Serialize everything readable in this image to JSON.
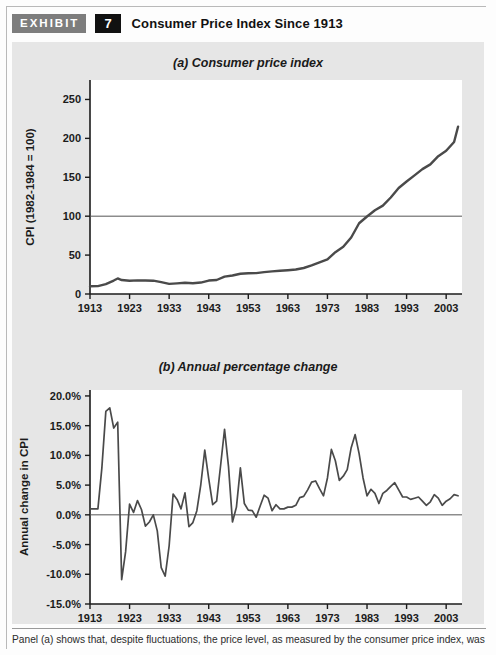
{
  "exhibit": {
    "tag_label": "EXHIBIT",
    "number": "7",
    "title": "Consumer Price Index Since 1913",
    "tag_bg": "#7d7d7d",
    "number_bg": "#111111",
    "panel_bg": "#e6e6e6"
  },
  "caption": {
    "text": "Panel (a) shows that, despite fluctuations, the price level, as measured by the consumer price index, was"
  },
  "chart_data": [
    {
      "id": "a",
      "type": "line",
      "title": "(a) Consumer price index",
      "xlabel": "",
      "ylabel": "CPI (1982-1984 = 100)",
      "ylim": [
        0,
        275
      ],
      "xlim": [
        1913,
        2007
      ],
      "yticks": [
        0,
        50,
        100,
        150,
        200,
        250
      ],
      "ytick_labels": [
        "0",
        "50",
        "100",
        "150",
        "200",
        "250"
      ],
      "xticks": [
        1913,
        1923,
        1933,
        1943,
        1953,
        1963,
        1973,
        1983,
        1993,
        2003
      ],
      "xtick_labels": [
        "1913",
        "1923",
        "1933",
        "1943",
        "1953",
        "1963",
        "1973",
        "1983",
        "1993",
        "2003"
      ],
      "grid": false,
      "reference_line": {
        "value": 100,
        "label": "100"
      },
      "legend": "none",
      "line_color": "#4a4a4a",
      "x": [
        1913,
        1915,
        1917,
        1919,
        1920,
        1921,
        1923,
        1925,
        1927,
        1929,
        1931,
        1933,
        1935,
        1937,
        1939,
        1941,
        1943,
        1945,
        1947,
        1949,
        1951,
        1953,
        1955,
        1957,
        1959,
        1961,
        1963,
        1965,
        1967,
        1969,
        1971,
        1973,
        1975,
        1977,
        1979,
        1981,
        1983,
        1985,
        1987,
        1989,
        1991,
        1993,
        1995,
        1997,
        1999,
        2001,
        2003,
        2005,
        2006
      ],
      "values": [
        9.9,
        10.1,
        12.8,
        17.3,
        20.0,
        17.9,
        17.1,
        17.5,
        17.4,
        17.1,
        15.2,
        13.0,
        13.7,
        14.4,
        13.9,
        14.7,
        17.3,
        18.0,
        22.3,
        23.8,
        26.0,
        26.7,
        26.8,
        28.1,
        29.1,
        29.9,
        30.6,
        31.5,
        33.4,
        36.7,
        40.5,
        44.4,
        53.8,
        60.6,
        72.6,
        90.9,
        99.6,
        107.6,
        113.6,
        124.0,
        136.2,
        144.5,
        152.4,
        160.5,
        166.6,
        177.1,
        184.0,
        195.3,
        215.0
      ]
    },
    {
      "id": "b",
      "type": "line",
      "title": "(b) Annual percentage change",
      "xlabel": "",
      "ylabel": "Annual change in CPI",
      "ylim": [
        -15,
        21
      ],
      "xlim": [
        1913,
        2007
      ],
      "yticks": [
        -15,
        -10,
        -5,
        0,
        5,
        10,
        15,
        20
      ],
      "ytick_labels": [
        "-15.0%",
        "-10.0%",
        "-5.0%",
        "0.0%",
        "5.0%",
        "10.0%",
        "15.0%",
        "20.0%"
      ],
      "xticks": [
        1913,
        1923,
        1933,
        1943,
        1953,
        1963,
        1973,
        1983,
        1993,
        2003
      ],
      "xtick_labels": [
        "1913",
        "1923",
        "1933",
        "1943",
        "1953",
        "1963",
        "1973",
        "1983",
        "1993",
        "2003"
      ],
      "grid": false,
      "reference_line": {
        "value": 0,
        "label": "0.0%"
      },
      "legend": "none",
      "line_color": "#4a4a4a",
      "x": [
        1913,
        1914,
        1915,
        1916,
        1917,
        1918,
        1919,
        1920,
        1921,
        1922,
        1923,
        1924,
        1925,
        1926,
        1927,
        1928,
        1929,
        1930,
        1931,
        1932,
        1933,
        1934,
        1935,
        1936,
        1937,
        1938,
        1939,
        1940,
        1941,
        1942,
        1943,
        1944,
        1945,
        1946,
        1947,
        1948,
        1949,
        1950,
        1951,
        1952,
        1953,
        1954,
        1955,
        1956,
        1957,
        1958,
        1959,
        1960,
        1961,
        1962,
        1963,
        1964,
        1965,
        1966,
        1967,
        1968,
        1969,
        1970,
        1971,
        1972,
        1973,
        1974,
        1975,
        1976,
        1977,
        1978,
        1979,
        1980,
        1981,
        1982,
        1983,
        1984,
        1985,
        1986,
        1987,
        1988,
        1989,
        1990,
        1991,
        1992,
        1993,
        1994,
        1995,
        1996,
        1997,
        1998,
        1999,
        2000,
        2001,
        2002,
        2003,
        2004,
        2005,
        2006
      ],
      "values": [
        1.0,
        1.0,
        1.0,
        7.9,
        17.4,
        18.0,
        14.6,
        15.6,
        -10.9,
        -6.2,
        1.8,
        0.4,
        2.4,
        0.9,
        -1.9,
        -1.2,
        0.0,
        -2.7,
        -8.9,
        -10.3,
        -5.2,
        3.5,
        2.6,
        1.0,
        3.7,
        -2.0,
        -1.3,
        0.7,
        5.1,
        10.9,
        6.1,
        1.7,
        2.3,
        8.3,
        14.4,
        8.1,
        -1.2,
        1.3,
        7.9,
        1.9,
        0.8,
        0.7,
        -0.4,
        1.5,
        3.3,
        2.8,
        0.7,
        1.7,
        1.0,
        1.0,
        1.3,
        1.3,
        1.6,
        2.9,
        3.1,
        4.2,
        5.5,
        5.7,
        4.4,
        3.2,
        6.2,
        11.0,
        9.1,
        5.8,
        6.5,
        7.6,
        11.3,
        13.5,
        10.3,
        6.2,
        3.2,
        4.3,
        3.6,
        1.9,
        3.6,
        4.1,
        4.8,
        5.4,
        4.2,
        3.0,
        3.0,
        2.6,
        2.8,
        3.0,
        2.3,
        1.6,
        2.2,
        3.4,
        2.8,
        1.6,
        2.3,
        2.7,
        3.4,
        3.2,
        -0.4
      ]
    }
  ]
}
